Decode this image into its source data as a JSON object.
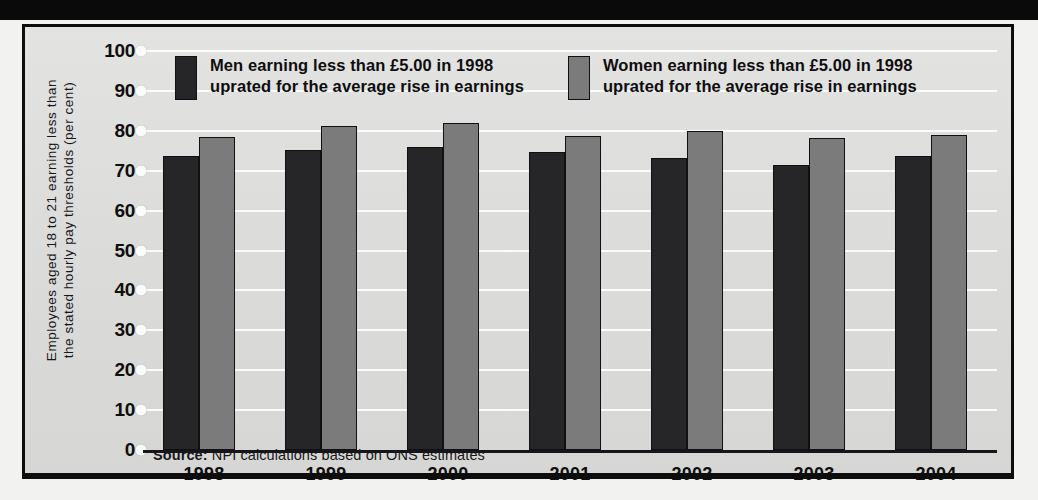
{
  "page": {
    "background_color": "#f2f2f0",
    "panel_color": "#dcdcda",
    "frame_color": "#0d0d0d"
  },
  "legend": {
    "position": "top-inside",
    "items": [
      {
        "key": "men",
        "label": "Men earning less than £5.00 in 1998\nuprated for the average rise in earnings",
        "color": "#262628"
      },
      {
        "key": "women",
        "label": "Women earning less than £5.00 in 1998\nuprated for the average rise in earnings",
        "color": "#7b7b7b"
      }
    ]
  },
  "axis": {
    "ylabel": "Employees aged 18 to 21 earning less than\nthe stated hourly pay thresholds (per cent)",
    "yticks": [
      "100",
      "90",
      "80",
      "70",
      "60",
      "50",
      "40",
      "30",
      "20",
      "10",
      "0"
    ]
  },
  "source": {
    "prefix": "Source:",
    "text": " NPI calculations based on ONS estimates"
  },
  "chart_data": {
    "type": "bar",
    "title": "",
    "subtitle": "",
    "xlabel": "",
    "ylabel": "Employees aged 18 to 21 earning less than the stated hourly pay thresholds (per cent)",
    "categories": [
      "1998",
      "1999",
      "2000",
      "2001",
      "2002",
      "2003",
      "2004"
    ],
    "series": [
      {
        "name": "Men earning less than £5.00 in 1998 uprated for the average rise in earnings",
        "color": "#262628",
        "values": [
          73.7,
          75.2,
          76.0,
          74.6,
          73.2,
          71.5,
          73.6
        ]
      },
      {
        "name": "Women earning less than £5.00 in 1998 uprated for the average rise in earnings",
        "color": "#7b7b7b",
        "values": [
          78.4,
          81.2,
          82.0,
          78.8,
          79.9,
          78.3,
          78.9
        ]
      }
    ],
    "ylim": [
      0,
      100
    ],
    "ytick_step": 10,
    "grid": true,
    "grid_axis": "y",
    "legend_position": "top-inside",
    "source": "Source: NPI calculations based on ONS estimates"
  }
}
